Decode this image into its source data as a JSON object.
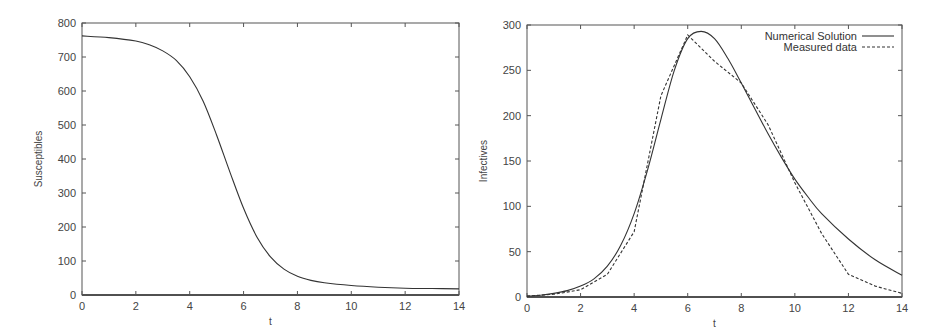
{
  "chart_data": [
    {
      "type": "line",
      "title": "",
      "xlabel": "t",
      "ylabel": "Susceptibles",
      "xlim": [
        0,
        14
      ],
      "ylim": [
        0,
        800
      ],
      "xticks": [
        0,
        2,
        4,
        6,
        8,
        10,
        12,
        14
      ],
      "yticks": [
        0,
        100,
        200,
        300,
        400,
        500,
        600,
        700,
        800
      ],
      "grid": false,
      "legend": null,
      "series": [
        {
          "name": "Susceptibles",
          "style": "solid",
          "x": [
            0,
            1,
            2,
            2.5,
            3,
            3.5,
            4,
            4.5,
            5,
            5.5,
            6,
            6.5,
            7,
            7.5,
            8,
            8.5,
            9,
            10,
            11,
            12,
            13,
            14
          ],
          "y": [
            762,
            757,
            747,
            736,
            718,
            690,
            642,
            570,
            470,
            360,
            255,
            170,
            112,
            76,
            55,
            43,
            36,
            28,
            23,
            20,
            19,
            18
          ]
        }
      ]
    },
    {
      "type": "line",
      "title": "",
      "xlabel": "t",
      "ylabel": "Infectives",
      "xlim": [
        0,
        14
      ],
      "ylim": [
        0,
        300
      ],
      "xticks": [
        0,
        2,
        4,
        6,
        8,
        10,
        12,
        14
      ],
      "yticks": [
        0,
        50,
        100,
        150,
        200,
        250,
        300
      ],
      "grid": false,
      "legend": {
        "position": "upper right",
        "entries": [
          "Numerical Solution",
          "Measured data"
        ]
      },
      "series": [
        {
          "name": "Numerical Solution",
          "style": "solid",
          "x": [
            0,
            0.5,
            1,
            1.5,
            2,
            2.5,
            3,
            3.5,
            4,
            4.5,
            5,
            5.5,
            6,
            6.5,
            7,
            7.5,
            8,
            8.5,
            9,
            9.5,
            10,
            10.5,
            11,
            12,
            13,
            14
          ],
          "y": [
            1,
            2,
            4,
            7,
            12,
            20,
            34,
            57,
            92,
            140,
            196,
            250,
            285,
            293,
            285,
            263,
            236,
            208,
            180,
            154,
            130,
            110,
            92,
            64,
            41,
            24
          ]
        },
        {
          "name": "Measured data",
          "style": "dashed",
          "x": [
            0,
            1,
            2,
            3,
            4,
            5,
            6,
            7,
            8,
            9,
            10,
            11,
            12,
            13,
            14
          ],
          "y": [
            1,
            3,
            8,
            25,
            72,
            222,
            289,
            260,
            236,
            190,
            126,
            70,
            25,
            12,
            4
          ]
        }
      ]
    }
  ]
}
